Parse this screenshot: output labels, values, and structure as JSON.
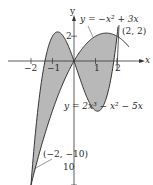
{
  "figure": {
    "type": "region-between-curves",
    "colors": {
      "fill": "#b8b8b8",
      "curve": "#333333",
      "axis": "#333333",
      "text": "#2a2a2a",
      "background": "#ffffff"
    },
    "x_axis": {
      "label": "x",
      "ticks": [
        -2,
        -1,
        1,
        2
      ],
      "tick_labels": [
        "−2",
        "−1",
        "1",
        "2"
      ]
    },
    "y_axis": {
      "label": "y",
      "ticks": [
        2,
        -10
      ],
      "tick_labels": [
        "2",
        "10"
      ]
    },
    "curves": [
      {
        "name": "parabola",
        "equation": "y = −x² + 3x"
      },
      {
        "name": "cubic",
        "equation": "y = 2x³ − x² − 5x"
      }
    ],
    "points": [
      {
        "label": "(2, 2)",
        "x": 2,
        "y": 2
      },
      {
        "label": "(−2, −10)",
        "x": -2,
        "y": -10
      }
    ]
  }
}
